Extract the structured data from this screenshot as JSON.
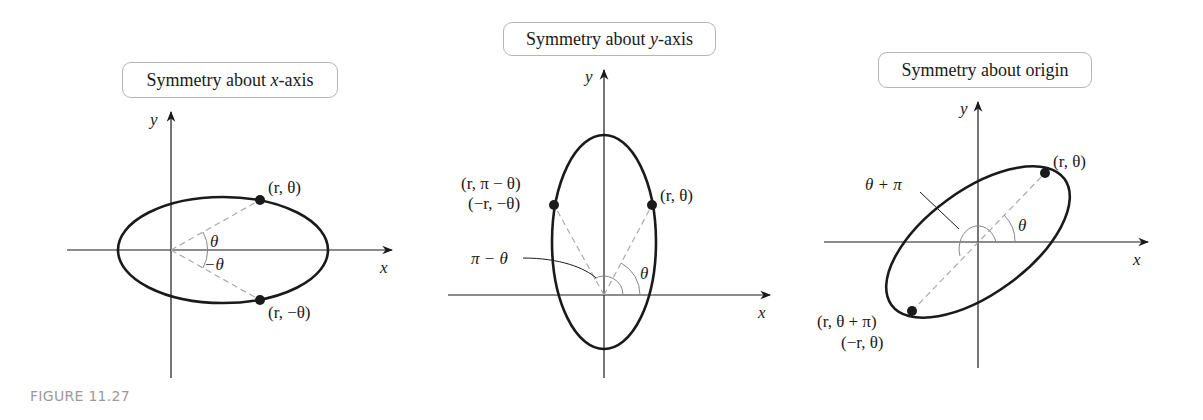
{
  "figure": {
    "caption": "FIGURE 11.27",
    "caption_color": "#9a9a9a",
    "curve_color": "#1a1a1a",
    "dashed_color": "#aaaaaa"
  },
  "panels": [
    {
      "title_prefix": "Symmetry about ",
      "title_var": "x",
      "title_suffix": "-axis",
      "axis_x_label": "x",
      "axis_y_label": "y",
      "points": [
        {
          "label": "(r, θ)"
        },
        {
          "label": "(r, −θ)"
        }
      ],
      "angle_labels": [
        "θ",
        "−θ"
      ]
    },
    {
      "title_prefix": "Symmetry about ",
      "title_var": "y",
      "title_suffix": "-axis",
      "axis_x_label": "x",
      "axis_y_label": "y",
      "points": [
        {
          "label": "(r, θ)"
        },
        {
          "label_line1": "(r, π − θ)",
          "label_line2": "(−r, −θ)"
        }
      ],
      "angle_labels": [
        "θ",
        "π − θ"
      ]
    },
    {
      "title_prefix": "Symmetry about origin",
      "title_var": "",
      "title_suffix": "",
      "axis_x_label": "x",
      "axis_y_label": "y",
      "points": [
        {
          "label": "(r, θ)"
        },
        {
          "label_line1": "(r, θ + π)",
          "label_line2": "(−r, θ)"
        }
      ],
      "angle_labels": [
        "θ",
        "θ + π"
      ]
    }
  ]
}
